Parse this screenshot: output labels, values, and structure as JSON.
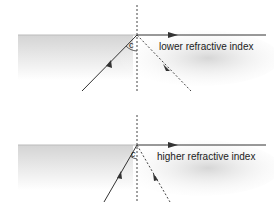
{
  "panels": [
    {
      "medium_label": "lower refractive index",
      "angle_label": "c"
    },
    {
      "medium_label": "higher refractive index",
      "angle_label": "c"
    }
  ],
  "colors": {
    "line": "#333333",
    "shade": "#d8d8d8"
  }
}
